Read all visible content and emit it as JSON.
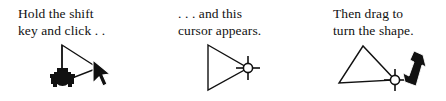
{
  "figure": {
    "background_color": "#ffffff",
    "ink_color": "#111111",
    "width": 446,
    "height": 101
  },
  "panels": [
    {
      "id": "panel-1",
      "caption_line_1": "Hold the shift",
      "caption_line_2": "key and click . .",
      "graphic": {
        "name": "triangle-with-anchor-and-pointer",
        "shape": "triangle-pointing-right",
        "markers": [
          "rotation-anchor-marker",
          "mouse-pointer-cursor"
        ]
      }
    },
    {
      "id": "panel-2",
      "caption_line_1": ". . . and this",
      "caption_line_2": "cursor appears.",
      "graphic": {
        "name": "triangle-with-rotate-cursor",
        "shape": "triangle-pointing-right",
        "markers": [
          "rotate-cursor"
        ]
      }
    },
    {
      "id": "panel-3",
      "caption_line_1": "Then drag to",
      "caption_line_2": "turn the shape.",
      "graphic": {
        "name": "rotated-triangle-with-drag-pointer",
        "shape": "triangle-rotated-apex-up",
        "markers": [
          "rotate-cursor",
          "drag-arrow-down-right"
        ]
      }
    }
  ]
}
